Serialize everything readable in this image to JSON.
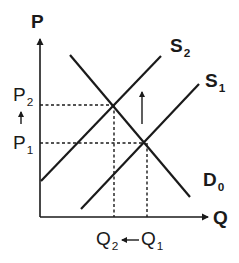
{
  "diagram": {
    "type": "supply-demand",
    "colors": {
      "line": "#1a1a1a",
      "background": "#ffffff"
    },
    "axes": {
      "y_label": "P",
      "x_label": "Q"
    },
    "curves": [
      {
        "name": "S1",
        "label_main": "S",
        "label_sub": "1",
        "kind": "supply"
      },
      {
        "name": "S2",
        "label_main": "S",
        "label_sub": "2",
        "kind": "supply"
      },
      {
        "name": "D0",
        "label_main": "D",
        "label_sub": "0",
        "kind": "demand"
      }
    ],
    "prices": [
      {
        "label_main": "P",
        "label_sub": "2"
      },
      {
        "label_main": "P",
        "label_sub": "1"
      }
    ],
    "quantities": [
      {
        "label_main": "Q",
        "label_sub": "2"
      },
      {
        "label_main": "Q",
        "label_sub": "1"
      }
    ],
    "annotations": {
      "price_arrow": "up-arrow",
      "supply_shift_arrow": "up-arrow",
      "quantity_arrow": "left-arrow"
    },
    "equilibria": [
      {
        "name": "E1",
        "price": "P1",
        "quantity": "Q1",
        "curves": [
          "S1",
          "D0"
        ]
      },
      {
        "name": "E2",
        "price": "P2",
        "quantity": "Q2",
        "curves": [
          "S2",
          "D0"
        ]
      }
    ]
  }
}
